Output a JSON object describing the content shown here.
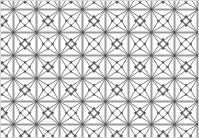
{
  "figure": {
    "type": "geometric-tiling-diagram",
    "width": 199,
    "height": 138,
    "background_color": "#ffffff",
    "border_color": "#d9d9d9"
  },
  "tiling": {
    "name": "snub square tiling",
    "vertex_configuration": "3.3.4.3.4",
    "unit_cell_px": 23,
    "origin_x": 12.5,
    "origin_y": 8.5,
    "cols": 8,
    "rows": 6,
    "edge_color_thin": "#6e6e6e",
    "edge_color_thick": "#9a9a9a",
    "vertex_color": "#4a4a4a",
    "edge_width_thin": 0.9,
    "edge_width_thick": 2.0,
    "vertex_radius": 1.15,
    "inner_square_ratio": 0.3
  },
  "chart_data": {
    "type": "scatter",
    "xlabel": "",
    "ylabel": "",
    "xlim": [
      0,
      199
    ],
    "ylim": [
      0,
      138
    ],
    "grid": false,
    "legend": null
  }
}
